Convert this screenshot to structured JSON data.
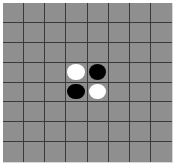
{
  "game": "othello",
  "board": {
    "rows": 8,
    "cols": 8,
    "colors": {
      "board": "#8f8f8f",
      "grid": "#3a3a3a",
      "white": "#ffffff",
      "black": "#000000"
    },
    "discs": [
      {
        "row": 3,
        "col": 3,
        "color": "white"
      },
      {
        "row": 3,
        "col": 4,
        "color": "black"
      },
      {
        "row": 4,
        "col": 3,
        "color": "black"
      },
      {
        "row": 4,
        "col": 4,
        "color": "white"
      }
    ]
  }
}
